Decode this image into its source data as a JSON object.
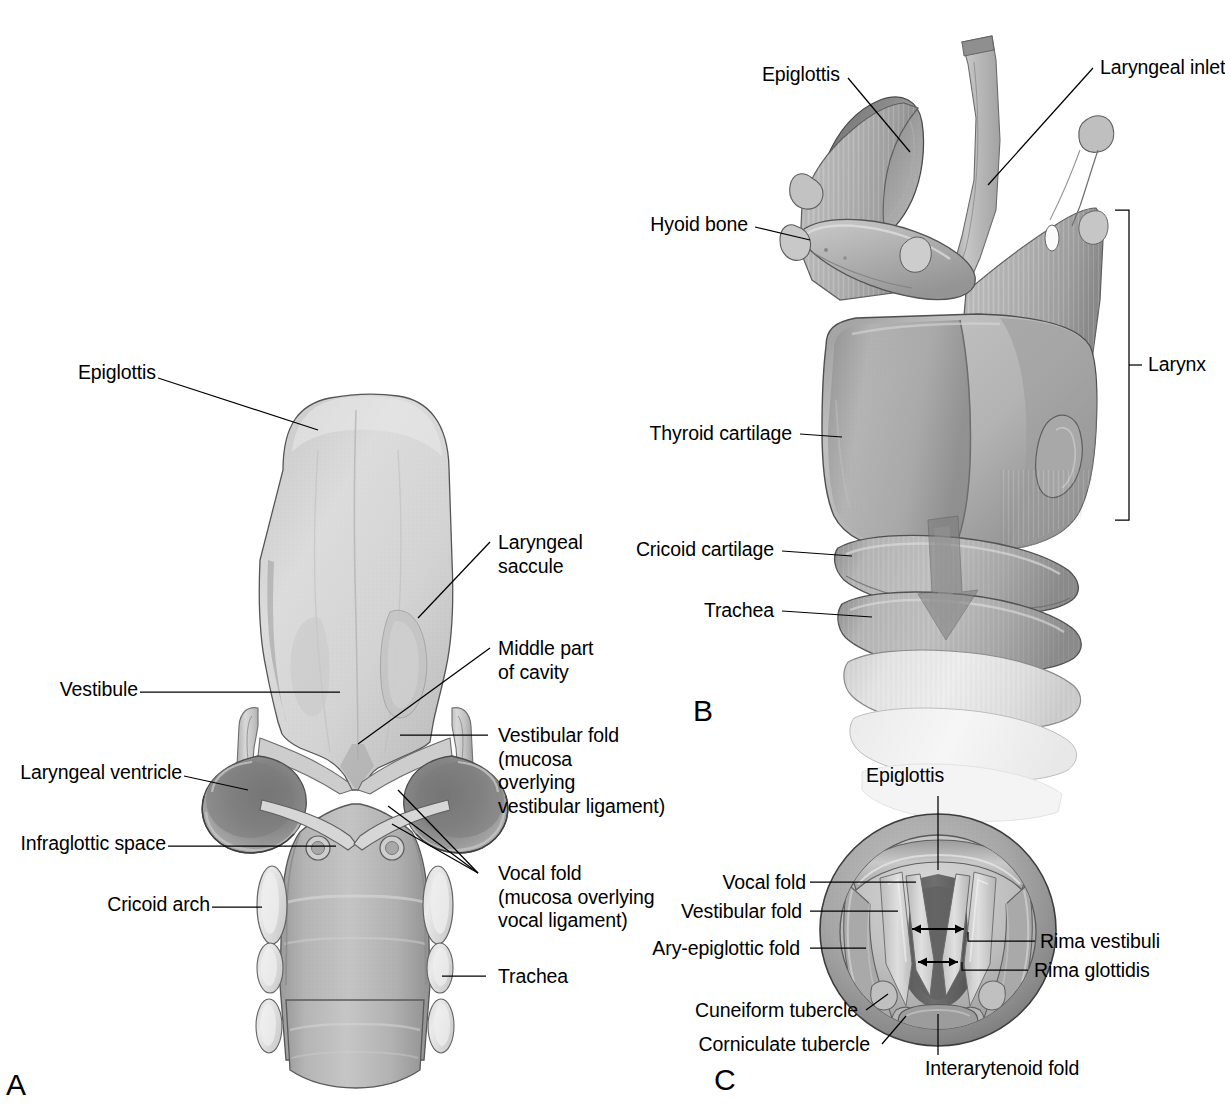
{
  "figure": {
    "panels": [
      {
        "letter": "A",
        "caption_hidden": "Coronal section of laryngeal cavity, posterior view",
        "labels": [
          {
            "name": "epiglottis",
            "text": "Epiglottis",
            "side": "left"
          },
          {
            "name": "vestibule",
            "text": "Vestibule",
            "side": "left"
          },
          {
            "name": "laryngeal-ventricle",
            "text": "Laryngeal ventricle",
            "side": "left"
          },
          {
            "name": "infraglottic-space",
            "text": "Infraglottic space",
            "side": "left"
          },
          {
            "name": "cricoid-arch",
            "text": "Cricoid arch",
            "side": "left"
          },
          {
            "name": "laryngeal-saccule",
            "text": "Laryngeal\nsaccule",
            "side": "right"
          },
          {
            "name": "middle-part-of-cavity",
            "text": "Middle part\nof cavity",
            "side": "right"
          },
          {
            "name": "vestibular-fold",
            "text": "Vestibular fold\n(mucosa\noverlying\nvestibular ligament)",
            "side": "right"
          },
          {
            "name": "vocal-fold",
            "text": "Vocal fold\n(mucosa overlying\nvocal ligament)",
            "side": "right"
          },
          {
            "name": "trachea",
            "text": "Trachea",
            "side": "right"
          }
        ]
      },
      {
        "letter": "B",
        "caption_hidden": "Larynx and upper trachea, oblique anterolateral view",
        "labels": [
          {
            "name": "epiglottis",
            "text": "Epiglottis",
            "side": "left"
          },
          {
            "name": "hyoid-bone",
            "text": "Hyoid bone",
            "side": "left"
          },
          {
            "name": "thyroid-cartilage",
            "text": "Thyroid cartilage",
            "side": "left"
          },
          {
            "name": "cricoid-cartilage",
            "text": "Cricoid cartilage",
            "side": "left"
          },
          {
            "name": "trachea",
            "text": "Trachea",
            "side": "left"
          },
          {
            "name": "laryngeal-inlet",
            "text": "Laryngeal inlet",
            "side": "right"
          },
          {
            "name": "larynx-bracket",
            "text": "Larynx",
            "side": "right"
          }
        ]
      },
      {
        "letter": "C",
        "caption_hidden": "Laryngoscopic view of the laryngeal inlet",
        "labels": [
          {
            "name": "epiglottis",
            "text": "Epiglottis",
            "side": "top"
          },
          {
            "name": "vocal-fold",
            "text": "Vocal fold",
            "side": "left"
          },
          {
            "name": "vestibular-fold",
            "text": "Vestibular fold",
            "side": "left"
          },
          {
            "name": "ary-epiglottic-fold",
            "text": "Ary-epiglottic fold",
            "side": "left"
          },
          {
            "name": "cuneiform-tubercle",
            "text": "Cuneiform tubercle",
            "side": "left"
          },
          {
            "name": "corniculate-tubercle",
            "text": "Corniculate tubercle",
            "side": "left"
          },
          {
            "name": "rima-vestibuli",
            "text": "Rima vestibuli",
            "side": "right"
          },
          {
            "name": "rima-glottidis",
            "text": "Rima glottidis",
            "side": "right"
          },
          {
            "name": "interarytenoid-fold",
            "text": "Interarytenoid fold",
            "side": "bottom"
          }
        ]
      }
    ]
  },
  "colors": {
    "ink": "#000000",
    "page": "#ffffff",
    "tissue_light": "#d8d8d8",
    "tissue_mid": "#b4b4b4",
    "tissue_dark": "#8d8d8d",
    "tissue_deep": "#6b6b6b",
    "cartilage_pale": "#e6e6e6",
    "outline": "#3b3b3b"
  }
}
